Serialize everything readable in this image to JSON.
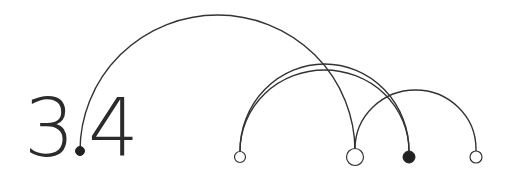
{
  "logo": {
    "major": "3",
    "minor": "4",
    "separator": "."
  },
  "diagram": {
    "stroke_color": "#333333",
    "fill_color": "#222222",
    "nodes": [
      {
        "id": "dot",
        "style": "filled"
      },
      {
        "id": "n1",
        "style": "hollow"
      },
      {
        "id": "n2",
        "style": "hollow-large"
      },
      {
        "id": "n3",
        "style": "filled"
      },
      {
        "id": "n4",
        "style": "hollow"
      }
    ],
    "arcs": [
      {
        "from": "dot",
        "to": "n2"
      },
      {
        "from": "n1",
        "to": "n3"
      },
      {
        "from": "n1",
        "to": "n3"
      },
      {
        "from": "n2",
        "to": "n4"
      }
    ]
  }
}
